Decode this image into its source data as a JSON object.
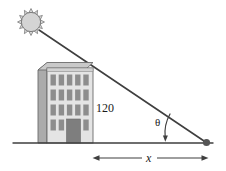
{
  "figure": {
    "type": "geometry-diagram",
    "width": 226,
    "height": 171
  },
  "labels": {
    "height": "120",
    "base": "x",
    "angle": "θ"
  },
  "icons": {
    "sun": "sun-icon",
    "building": "building-icon",
    "ground": "ground-line",
    "ray": "sun-ray-line",
    "shadow_tip": "shadow-tip-dot",
    "angle_arc": "angle-arc-arrow",
    "dimension": "dimension-arrow-x"
  },
  "colors": {
    "outline": "#4d4d4d",
    "line": "#3a3a3a",
    "sun_fill": "#d4d4d4",
    "building_front": "#e2e2e2",
    "building_side": "#a8a8a8",
    "building_roof": "#c9c9c9",
    "window": "#8d8d8d",
    "door": "#7e7e7e",
    "text": "#1a1a1a"
  },
  "geometry": {
    "sun_center": [
      31,
      22
    ],
    "sun_radius": 10,
    "ray_start": [
      39,
      30
    ],
    "ray_end": [
      207,
      143
    ],
    "ground_y": 143,
    "ground_start_x": 13,
    "ground_end_x": 213,
    "building_left_x": 38,
    "building_right_x": 93,
    "building_top_y": 62,
    "dimension_y": 158,
    "dimension_start_x": 93,
    "dimension_end_x": 208
  }
}
